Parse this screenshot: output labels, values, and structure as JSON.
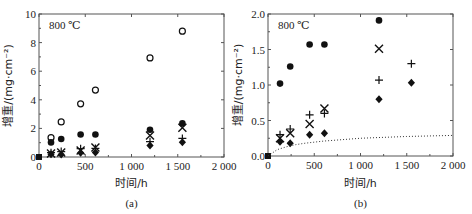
{
  "chart_data": [
    {
      "type": "scatter",
      "panel_label": "(a)",
      "annotation": "800 ℃",
      "xlabel": "时间/h",
      "ylabel": "增重/(mg·cm⁻²)",
      "xlim": [
        0,
        2000
      ],
      "ylim": [
        0,
        10
      ],
      "xticks": [
        "0",
        "500",
        "1 000",
        "1 500",
        "2 000"
      ],
      "yticks": [
        "0",
        "2",
        "4",
        "6",
        "8",
        "10"
      ],
      "grid": false,
      "series": [
        {
          "name": "open-circle",
          "marker": "circle-open",
          "x": [
            0,
            130,
            240,
            450,
            610,
            1200,
            1550
          ],
          "y": [
            0,
            1.35,
            2.45,
            3.72,
            4.68,
            6.93,
            8.8
          ]
        },
        {
          "name": "filled-circle",
          "marker": "circle-filled",
          "x": [
            0,
            130,
            240,
            450,
            610,
            1200,
            1550
          ],
          "y": [
            0,
            1.02,
            1.26,
            1.57,
            1.57,
            1.91,
            2.35
          ]
        },
        {
          "name": "cross-x",
          "marker": "x",
          "x": [
            0,
            130,
            240,
            450,
            610,
            1200,
            1550
          ],
          "y": [
            0,
            0.25,
            0.32,
            0.45,
            0.67,
            1.51,
            2.05
          ]
        },
        {
          "name": "plus",
          "marker": "plus",
          "x": [
            0,
            130,
            240,
            450,
            610,
            1200,
            1550
          ],
          "y": [
            0,
            0.3,
            0.38,
            0.58,
            0.6,
            1.07,
            1.3
          ]
        },
        {
          "name": "filled-diamond",
          "marker": "diamond-filled",
          "x": [
            0,
            130,
            240,
            450,
            610,
            1200,
            1550
          ],
          "y": [
            0,
            0.2,
            0.18,
            0.3,
            0.32,
            0.8,
            1.03
          ]
        }
      ]
    },
    {
      "type": "scatter",
      "panel_label": "(b)",
      "annotation": "800 ℃",
      "xlabel": "时间/h",
      "ylabel": "增重/(mg·cm⁻²)",
      "xlim": [
        0,
        2000
      ],
      "ylim": [
        0,
        2.0
      ],
      "xticks": [
        "0",
        "500",
        "1 000",
        "1 500",
        "2 000"
      ],
      "yticks": [
        "0.0",
        "0.5",
        "1.0",
        "1.5",
        "2.0"
      ],
      "grid": false,
      "series": [
        {
          "name": "filled-circle",
          "marker": "circle-filled",
          "x": [
            0,
            130,
            240,
            450,
            610,
            1200
          ],
          "y": [
            0,
            1.02,
            1.26,
            1.57,
            1.57,
            1.91
          ]
        },
        {
          "name": "cross-x",
          "marker": "x",
          "x": [
            0,
            130,
            240,
            450,
            610,
            1200
          ],
          "y": [
            0,
            0.25,
            0.32,
            0.45,
            0.67,
            1.51
          ]
        },
        {
          "name": "plus",
          "marker": "plus",
          "x": [
            0,
            130,
            240,
            450,
            610,
            1200,
            1550
          ],
          "y": [
            0,
            0.3,
            0.38,
            0.58,
            0.6,
            1.07,
            1.3
          ]
        },
        {
          "name": "filled-diamond",
          "marker": "diamond-filled",
          "x": [
            0,
            130,
            240,
            450,
            610,
            1200,
            1550
          ],
          "y": [
            0,
            0.2,
            0.18,
            0.3,
            0.32,
            0.8,
            1.03
          ]
        },
        {
          "name": "dotted-curve",
          "marker": "none",
          "line": "dotted",
          "x": [
            0,
            100,
            200,
            300,
            400,
            600,
            800,
            1000,
            1200,
            1500,
            2000
          ],
          "y": [
            0,
            0.09,
            0.13,
            0.16,
            0.18,
            0.21,
            0.23,
            0.25,
            0.26,
            0.275,
            0.29
          ]
        }
      ]
    }
  ]
}
